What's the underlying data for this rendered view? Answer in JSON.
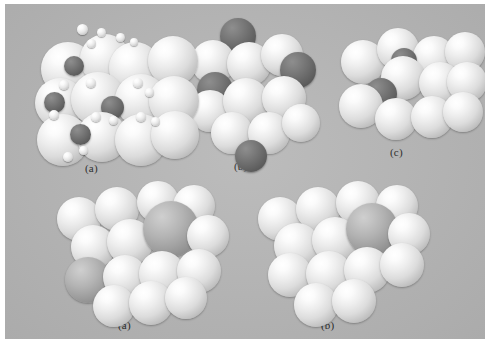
{
  "figure": {
    "plate_background_color": "#b8b8b8",
    "page_background_color": "#ffffff",
    "label_color": "#2a2a2a",
    "atom_colors": {
      "light": "#f0f0f0",
      "mid": "#b3b3b3",
      "dark": "#6a6a6a",
      "tiny": "#f4f4f4"
    },
    "rows": [
      {
        "row_index": 0,
        "panels": [
          {
            "id": "top-a",
            "label": "(a)",
            "label_x": 80,
            "label_y": 160
          },
          {
            "id": "top-b",
            "label": "(b)",
            "label_x": 229,
            "label_y": 158
          },
          {
            "id": "top-c",
            "label": "(c)",
            "label_x": 385,
            "label_y": 145
          }
        ]
      },
      {
        "row_index": 1,
        "panels": [
          {
            "id": "bottom-a",
            "label": "(a)",
            "label_x": 112,
            "label_y": 318
          },
          {
            "id": "bottom-b",
            "label": "(b)",
            "label_x": 315,
            "label_y": 318
          }
        ]
      }
    ],
    "panel_top_a": {
      "atoms": [
        {
          "x": 18,
          "y": 26,
          "d": 54,
          "type": "light"
        },
        {
          "x": 57,
          "y": 18,
          "d": 50,
          "type": "light"
        },
        {
          "x": 86,
          "y": 26,
          "d": 52,
          "type": "light"
        },
        {
          "x": 125,
          "y": 20,
          "d": 50,
          "type": "light"
        },
        {
          "x": 41,
          "y": 40,
          "d": 20,
          "type": "dark"
        },
        {
          "x": 54,
          "y": 8,
          "d": 11,
          "type": "tiny"
        },
        {
          "x": 74,
          "y": 12,
          "d": 9,
          "type": "tiny"
        },
        {
          "x": 93,
          "y": 17,
          "d": 9,
          "type": "tiny"
        },
        {
          "x": 107,
          "y": 22,
          "d": 8,
          "type": "tiny"
        },
        {
          "x": 64,
          "y": 23,
          "d": 9,
          "type": "tiny"
        },
        {
          "x": 12,
          "y": 62,
          "d": 50,
          "type": "light"
        },
        {
          "x": 48,
          "y": 56,
          "d": 54,
          "type": "light"
        },
        {
          "x": 92,
          "y": 58,
          "d": 52,
          "type": "light"
        },
        {
          "x": 126,
          "y": 60,
          "d": 50,
          "type": "light"
        },
        {
          "x": 21,
          "y": 76,
          "d": 21,
          "type": "dark"
        },
        {
          "x": 78,
          "y": 80,
          "d": 23,
          "type": "dark"
        },
        {
          "x": 36,
          "y": 64,
          "d": 10,
          "type": "tiny"
        },
        {
          "x": 63,
          "y": 62,
          "d": 10,
          "type": "tiny"
        },
        {
          "x": 110,
          "y": 62,
          "d": 10,
          "type": "tiny"
        },
        {
          "x": 122,
          "y": 72,
          "d": 9,
          "type": "tiny"
        },
        {
          "x": 14,
          "y": 98,
          "d": 52,
          "type": "light"
        },
        {
          "x": 54,
          "y": 96,
          "d": 50,
          "type": "light"
        },
        {
          "x": 92,
          "y": 98,
          "d": 52,
          "type": "light"
        },
        {
          "x": 128,
          "y": 95,
          "d": 48,
          "type": "light"
        },
        {
          "x": 47,
          "y": 108,
          "d": 21,
          "type": "dark"
        },
        {
          "x": 26,
          "y": 94,
          "d": 10,
          "type": "tiny"
        },
        {
          "x": 68,
          "y": 96,
          "d": 10,
          "type": "tiny"
        },
        {
          "x": 86,
          "y": 100,
          "d": 9,
          "type": "tiny"
        },
        {
          "x": 113,
          "y": 96,
          "d": 10,
          "type": "tiny"
        },
        {
          "x": 128,
          "y": 101,
          "d": 9,
          "type": "tiny"
        },
        {
          "x": 40,
          "y": 136,
          "d": 10,
          "type": "tiny"
        },
        {
          "x": 56,
          "y": 130,
          "d": 9,
          "type": "tiny"
        }
      ]
    },
    "panel_top_b": {
      "atoms": [
        {
          "x": 33,
          "y": 2,
          "d": 36,
          "type": "dark"
        },
        {
          "x": 4,
          "y": 24,
          "d": 44,
          "type": "light"
        },
        {
          "x": 40,
          "y": 26,
          "d": 44,
          "type": "light"
        },
        {
          "x": 74,
          "y": 18,
          "d": 42,
          "type": "light"
        },
        {
          "x": 93,
          "y": 36,
          "d": 36,
          "type": "dark"
        },
        {
          "x": 10,
          "y": 56,
          "d": 36,
          "type": "dark"
        },
        {
          "x": 2,
          "y": 74,
          "d": 42,
          "type": "light"
        },
        {
          "x": 36,
          "y": 62,
          "d": 46,
          "type": "light"
        },
        {
          "x": 75,
          "y": 60,
          "d": 44,
          "type": "light"
        },
        {
          "x": 24,
          "y": 96,
          "d": 42,
          "type": "light"
        },
        {
          "x": 61,
          "y": 96,
          "d": 42,
          "type": "light"
        },
        {
          "x": 95,
          "y": 88,
          "d": 38,
          "type": "light"
        },
        {
          "x": 48,
          "y": 124,
          "d": 32,
          "type": "dark"
        }
      ]
    },
    "panel_top_c": {
      "atoms": [
        {
          "x": 6,
          "y": 18,
          "d": 44,
          "type": "light"
        },
        {
          "x": 42,
          "y": 6,
          "d": 42,
          "type": "light"
        },
        {
          "x": 78,
          "y": 14,
          "d": 42,
          "type": "light"
        },
        {
          "x": 110,
          "y": 10,
          "d": 40,
          "type": "light"
        },
        {
          "x": 56,
          "y": 26,
          "d": 26,
          "type": "dark"
        },
        {
          "x": 46,
          "y": 34,
          "d": 44,
          "type": "light"
        },
        {
          "x": 84,
          "y": 40,
          "d": 42,
          "type": "light"
        },
        {
          "x": 112,
          "y": 40,
          "d": 40,
          "type": "light"
        },
        {
          "x": 30,
          "y": 56,
          "d": 32,
          "type": "dark"
        },
        {
          "x": 4,
          "y": 62,
          "d": 44,
          "type": "light"
        },
        {
          "x": 40,
          "y": 76,
          "d": 42,
          "type": "light"
        },
        {
          "x": 76,
          "y": 74,
          "d": 42,
          "type": "light"
        },
        {
          "x": 108,
          "y": 70,
          "d": 40,
          "type": "light"
        }
      ]
    },
    "panel_bottom_a": {
      "atoms": [
        {
          "x": 12,
          "y": 18,
          "d": 44,
          "type": "light"
        },
        {
          "x": 50,
          "y": 8,
          "d": 44,
          "type": "light"
        },
        {
          "x": 92,
          "y": 2,
          "d": 42,
          "type": "light"
        },
        {
          "x": 128,
          "y": 6,
          "d": 42,
          "type": "light"
        },
        {
          "x": 26,
          "y": 46,
          "d": 44,
          "type": "light"
        },
        {
          "x": 62,
          "y": 40,
          "d": 46,
          "type": "light"
        },
        {
          "x": 98,
          "y": 22,
          "d": 56,
          "type": "mid"
        },
        {
          "x": 142,
          "y": 36,
          "d": 42,
          "type": "light"
        },
        {
          "x": 20,
          "y": 78,
          "d": 46,
          "type": "mid"
        },
        {
          "x": 58,
          "y": 76,
          "d": 44,
          "type": "light"
        },
        {
          "x": 94,
          "y": 72,
          "d": 46,
          "type": "light"
        },
        {
          "x": 132,
          "y": 70,
          "d": 44,
          "type": "light"
        },
        {
          "x": 48,
          "y": 106,
          "d": 42,
          "type": "light"
        },
        {
          "x": 84,
          "y": 102,
          "d": 44,
          "type": "light"
        },
        {
          "x": 120,
          "y": 98,
          "d": 42,
          "type": "light"
        }
      ]
    },
    "panel_bottom_b": {
      "atoms": [
        {
          "x": 8,
          "y": 18,
          "d": 44,
          "type": "light"
        },
        {
          "x": 46,
          "y": 8,
          "d": 44,
          "type": "light"
        },
        {
          "x": 86,
          "y": 2,
          "d": 44,
          "type": "light"
        },
        {
          "x": 126,
          "y": 6,
          "d": 42,
          "type": "light"
        },
        {
          "x": 24,
          "y": 44,
          "d": 46,
          "type": "light"
        },
        {
          "x": 62,
          "y": 38,
          "d": 46,
          "type": "light"
        },
        {
          "x": 96,
          "y": 24,
          "d": 52,
          "type": "mid"
        },
        {
          "x": 138,
          "y": 34,
          "d": 42,
          "type": "light"
        },
        {
          "x": 18,
          "y": 74,
          "d": 44,
          "type": "light"
        },
        {
          "x": 56,
          "y": 72,
          "d": 46,
          "type": "light"
        },
        {
          "x": 94,
          "y": 68,
          "d": 46,
          "type": "light"
        },
        {
          "x": 130,
          "y": 64,
          "d": 44,
          "type": "light"
        },
        {
          "x": 44,
          "y": 104,
          "d": 44,
          "type": "light"
        },
        {
          "x": 82,
          "y": 100,
          "d": 44,
          "type": "light"
        }
      ]
    }
  }
}
